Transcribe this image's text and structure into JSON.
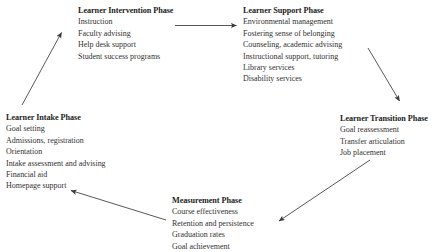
{
  "diagram": {
    "text_color": "#333132",
    "heading_color": "#1d1d1d",
    "arrow_color": "#3a3a3a",
    "background": "#ffffff",
    "phases": [
      {
        "id": "intervention",
        "title": "Learner Intervention Phase",
        "items": [
          "Instruction",
          "Faculty advising",
          "Help desk support",
          "Student success programs"
        ]
      },
      {
        "id": "support",
        "title": "Learner Support Phase",
        "items": [
          "Environmental management",
          "Fostering sense of belonging",
          "Counseling, academic advising",
          "Instructional support, tutoring",
          "Library services",
          "Disability services"
        ]
      },
      {
        "id": "transition",
        "title": "Learner Transition Phase",
        "items": [
          "Goal reassessment",
          "Transfer articulation",
          "Job placement"
        ]
      },
      {
        "id": "measurement",
        "title": "Measurement Phase",
        "items": [
          "Course effectiveness",
          "Retention and persistence",
          "Graduation rates",
          "Goal achievement"
        ]
      },
      {
        "id": "intake",
        "title": "Learner Intake Phase",
        "items": [
          "Goal setting",
          "Admissions, registration",
          "Orientation",
          "Intake assessment and advising",
          "Financial aid",
          "Homepage support"
        ]
      }
    ],
    "arrows": [
      {
        "id": "intervention-to-support",
        "from": "intervention",
        "to": "support",
        "direction": "right"
      },
      {
        "id": "support-to-transition",
        "from": "support",
        "to": "transition",
        "direction": "down-right"
      },
      {
        "id": "transition-to-measurement",
        "from": "transition",
        "to": "measurement",
        "direction": "down-left"
      },
      {
        "id": "measurement-to-intake",
        "from": "measurement",
        "to": "intake",
        "direction": "up-left"
      },
      {
        "id": "intake-to-intervention",
        "from": "intake",
        "to": "intervention",
        "direction": "up-right"
      }
    ]
  }
}
